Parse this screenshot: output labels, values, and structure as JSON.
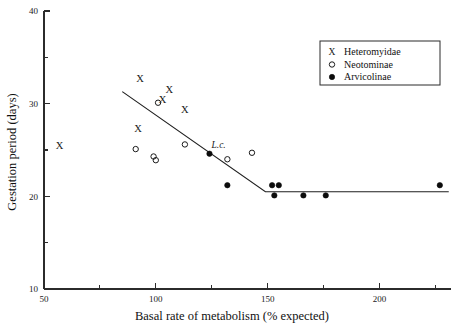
{
  "chart_data": {
    "type": "scatter",
    "title": "",
    "xlabel": "Basal rate of metabolism (% expected)",
    "ylabel": "Gestation period (days)",
    "xlim": [
      50,
      232
    ],
    "ylim": [
      10,
      40
    ],
    "grid": false,
    "legend_position": "top-right",
    "x_ticks_major": [
      50,
      100,
      150,
      200
    ],
    "x_ticks_minor": [
      75,
      125,
      175,
      225
    ],
    "y_ticks_major": [
      10,
      20,
      30,
      40
    ],
    "y_ticks_minor": [
      15,
      25,
      35
    ],
    "series": [
      {
        "name": "Heteromyidae",
        "marker": "x",
        "points": [
          {
            "x": 57,
            "y": 25.5
          },
          {
            "x": 92,
            "y": 27.3
          },
          {
            "x": 93,
            "y": 32.7
          },
          {
            "x": 103,
            "y": 30.4
          },
          {
            "x": 106,
            "y": 31.5
          },
          {
            "x": 113,
            "y": 29.4
          }
        ]
      },
      {
        "name": "Neotominae",
        "marker": "open-circle",
        "points": [
          {
            "x": 91,
            "y": 25.1
          },
          {
            "x": 99,
            "y": 24.3
          },
          {
            "x": 100,
            "y": 23.9
          },
          {
            "x": 101,
            "y": 30.1
          },
          {
            "x": 113,
            "y": 25.6
          },
          {
            "x": 132,
            "y": 24.0
          },
          {
            "x": 143,
            "y": 24.7
          }
        ]
      },
      {
        "name": "Arvicolinae",
        "marker": "filled-circle",
        "points": [
          {
            "x": 124,
            "y": 24.6,
            "label": "L.c."
          },
          {
            "x": 132,
            "y": 21.2
          },
          {
            "x": 152,
            "y": 21.2
          },
          {
            "x": 153,
            "y": 20.1
          },
          {
            "x": 155,
            "y": 21.2
          },
          {
            "x": 166,
            "y": 20.1
          },
          {
            "x": 176,
            "y": 20.1
          },
          {
            "x": 227,
            "y": 21.2
          }
        ]
      }
    ],
    "fit_line": {
      "type": "piecewise-linear",
      "vertices": [
        {
          "x": 85,
          "y": 31.3
        },
        {
          "x": 149,
          "y": 20.5
        },
        {
          "x": 231,
          "y": 20.5
        }
      ]
    },
    "annotations": [
      {
        "text": "L.c.",
        "x": 124,
        "y": 24.6,
        "style": "italic"
      }
    ],
    "legend": [
      {
        "symbol": "x",
        "label": "Heteromyidae"
      },
      {
        "symbol": "open-circle",
        "label": "Neotominae"
      },
      {
        "symbol": "filled-circle",
        "label": "Arvicolinae"
      }
    ]
  }
}
